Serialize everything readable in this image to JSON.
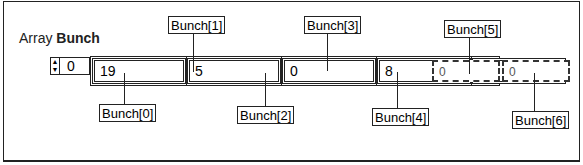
{
  "title": {
    "prefix": "Array ",
    "name": "Bunch"
  },
  "index": {
    "value": "0",
    "icon": "spinner-icon"
  },
  "cells": [
    {
      "value": "19",
      "label": "Bunch[0]",
      "defined": true
    },
    {
      "value": "5",
      "label": "Bunch[1]",
      "defined": true
    },
    {
      "value": "0",
      "label": "Bunch[2]",
      "defined": true
    },
    {
      "value": "8",
      "label": "Bunch[3]",
      "defined": true
    },
    {
      "value": "14",
      "label": "Bunch[4]",
      "defined": true
    },
    {
      "value": "0",
      "label": "Bunch[5]",
      "defined": false
    },
    {
      "value": "0",
      "label": "Bunch[6]",
      "defined": false
    }
  ]
}
